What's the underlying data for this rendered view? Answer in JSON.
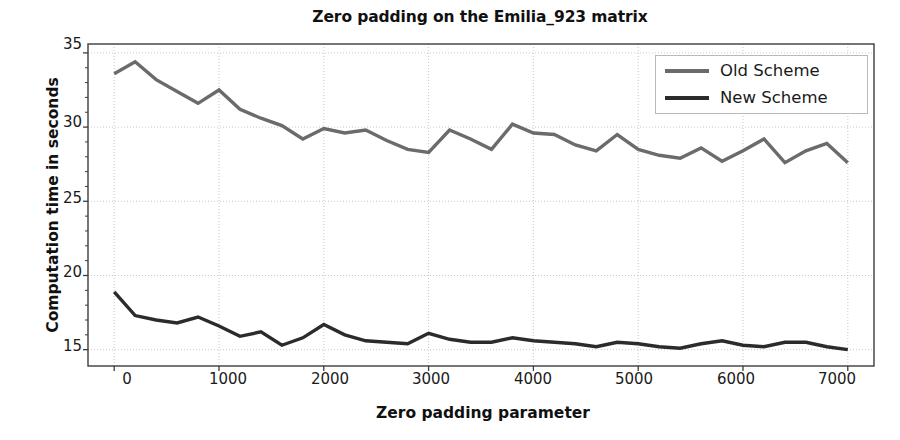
{
  "chart_data": {
    "type": "line",
    "title": "Zero padding on the Emilia_923 matrix",
    "xlabel": "Zero padding parameter",
    "ylabel": "Computation time in seconds",
    "xlim": [
      -250,
      7250
    ],
    "ylim": [
      13.9,
      35.6
    ],
    "xticks": [
      0,
      1000,
      2000,
      3000,
      4000,
      5000,
      6000,
      7000
    ],
    "yticks": [
      15,
      20,
      25,
      30,
      35
    ],
    "grid": true,
    "legend_position": "upper right",
    "x": [
      0,
      200,
      400,
      600,
      800,
      1000,
      1200,
      1400,
      1600,
      1800,
      2000,
      2200,
      2400,
      2600,
      2800,
      3000,
      3200,
      3400,
      3600,
      3800,
      4000,
      4200,
      4400,
      4600,
      4800,
      5000,
      5200,
      5400,
      5600,
      5800,
      6000,
      6200,
      6400,
      6600,
      6800,
      7000
    ],
    "series": [
      {
        "name": "Old Scheme",
        "color": "#6b6b6b",
        "values": [
          33.6,
          34.4,
          33.2,
          32.4,
          31.6,
          32.5,
          31.2,
          30.6,
          30.1,
          29.2,
          29.9,
          29.6,
          29.8,
          29.1,
          28.5,
          28.3,
          29.8,
          29.2,
          28.5,
          30.2,
          29.6,
          29.5,
          28.8,
          28.4,
          29.5,
          28.5,
          28.1,
          27.9,
          28.6,
          27.7,
          28.4,
          29.2,
          27.6,
          28.4,
          28.9,
          27.6
        ]
      },
      {
        "name": "New Scheme",
        "color": "#2b2b2b",
        "values": [
          18.9,
          17.3,
          17.0,
          16.8,
          17.2,
          16.6,
          15.9,
          16.2,
          15.3,
          15.8,
          16.7,
          16.0,
          15.6,
          15.5,
          15.4,
          16.1,
          15.7,
          15.5,
          15.5,
          15.8,
          15.6,
          15.5,
          15.4,
          15.2,
          15.5,
          15.4,
          15.2,
          15.1,
          15.4,
          15.6,
          15.3,
          15.2,
          15.5,
          15.5,
          15.2,
          15.0
        ]
      }
    ]
  },
  "legend": {
    "items": [
      {
        "label": "Old Scheme"
      },
      {
        "label": "New Scheme"
      }
    ]
  },
  "colors": {
    "old_scheme": "#6b6b6b",
    "new_scheme": "#2b2b2b",
    "axis": "#3c3c3c",
    "grid": "#c9c9c9",
    "background": "#ffffff"
  }
}
